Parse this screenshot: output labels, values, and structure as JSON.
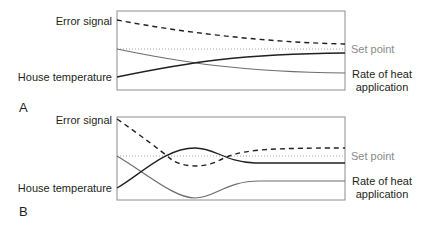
{
  "figure": {
    "panels": [
      {
        "letter": "A",
        "labels": {
          "error_signal": "Error signal",
          "house_temperature": "House temperature",
          "set_point": "Set point",
          "rate_line1": "Rate of heat",
          "rate_line2": "application"
        },
        "curves": {
          "error_signal": "M117,20 C180,32 260,42 345,44",
          "heat_rate": "M117,49 C180,62 240,72 345,73",
          "house_temperature": "M117,77 C190,62 240,54 345,53",
          "set_point": "M117,49 L345,49"
        }
      },
      {
        "letter": "B",
        "labels": {
          "error_signal": "Error signal",
          "house_temperature": "House temperature",
          "set_point": "Set point",
          "rate_line1": "Rate of heat",
          "rate_line2": "application"
        },
        "curves": {
          "error_signal": "M117,119 C140,135 160,150 172,160 C185,168 205,168 220,160 C240,150 260,148 345,148",
          "heat_rate": "M117,156 C150,176 175,198 195,198 C215,198 225,181 260,181 L345,181",
          "house_temperature": "M117,188 C140,175 165,148 195,148 C215,148 225,162 255,163 L345,163",
          "set_point": "M117,156 L345,156"
        }
      }
    ],
    "colors": {
      "dark_line": "#231f20",
      "grey_line": "#6d6d6d",
      "set_point": "#a0a0a0",
      "frame": "#8c8c8c"
    }
  }
}
